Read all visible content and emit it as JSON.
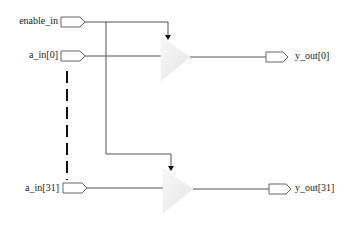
{
  "diagram": {
    "type": "tri-state buffer array schematic",
    "inputs": [
      {
        "label": "enable_in"
      },
      {
        "label": "a_in[0]"
      },
      {
        "label": "a_in[31]"
      }
    ],
    "outputs": [
      {
        "label": "y_out[0]"
      },
      {
        "label": "y_out[31]"
      }
    ],
    "colors": {
      "wire": "#555555",
      "port_stroke": "#666666",
      "buffer_fill": "#f2f2f2",
      "dash": "#111111"
    }
  }
}
